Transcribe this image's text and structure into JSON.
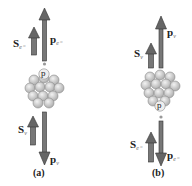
{
  "panels": [
    {
      "caption": "(a)",
      "spin_top": {
        "symbol": "S",
        "subscript": "e⁻"
      },
      "momentum_top": {
        "symbol": "p",
        "subscript": "e⁻"
      },
      "spin_bottom": {
        "symbol": "S",
        "subscript": "ν"
      },
      "momentum_bottom": {
        "symbol": "p",
        "subscript": "ν"
      },
      "proton_label": "p"
    },
    {
      "caption": "(b)",
      "spin_top": {
        "symbol": "S",
        "subscript": "ν"
      },
      "momentum_top": {
        "symbol": "p",
        "subscript": "ν"
      },
      "spin_bottom": {
        "symbol": "S",
        "subscript": "e⁻"
      },
      "momentum_bottom": {
        "symbol": "p",
        "subscript": "e⁻"
      },
      "proton_label": "p"
    }
  ],
  "colors": {
    "arrow": "#666666",
    "arrow_outline": "#333333",
    "nucleon": "#c8c8c8",
    "nucleon_edge": "#8a8a8a"
  }
}
